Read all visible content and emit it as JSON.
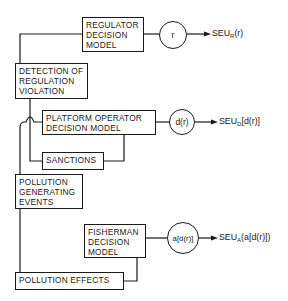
{
  "diagram": {
    "boxes": {
      "regulator": "REGULATOR\nDECISION\nMODEL",
      "detection": "DETECTION OF\nREGULATION\nVIOLATION",
      "platform": "PLATFORM  OPERATOR\nDECISION  MODEL",
      "sanctions": "SANCTIONS",
      "pollution_events": "POLLUTION\nGENERATING\nEVENTS",
      "fisherman": "FISHERMAN\nDECISION\nMODEL",
      "pollution_effects": "POLLUTION  EFFECTS"
    },
    "decisions": {
      "regulator": "r",
      "platform": "d(r)",
      "fisherman": "a[d(r)]"
    },
    "outcomes": {
      "regulator": {
        "base": "SEU",
        "sub": "R",
        "arg": "(r)"
      },
      "platform": {
        "base": "SEU",
        "sub": "D",
        "arg": "[d(r)]"
      },
      "fisherman": {
        "base": "SEU",
        "sub": "A",
        "arg": "(a[d(r)])"
      }
    }
  }
}
